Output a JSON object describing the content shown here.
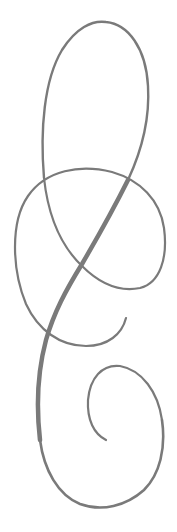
{
  "artwork": {
    "type": "calligraphic-flourish",
    "stroke_color": "#7a7a7a",
    "background": "#ffffff"
  }
}
